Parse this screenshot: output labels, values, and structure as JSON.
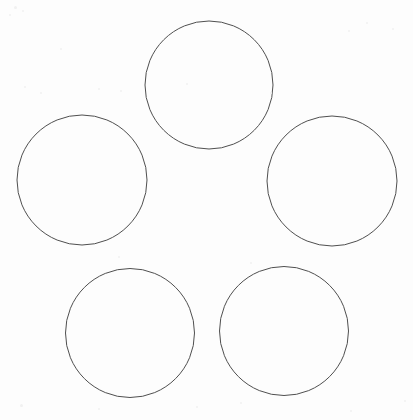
{
  "page": {
    "width": 413,
    "height": 420,
    "background_color": "#fdfdfd",
    "paper_type": "scanned-white-paper"
  },
  "figure": {
    "name": "five-circle-pentagon-arrangement",
    "shape_count": 5,
    "stroke_color": "#4f4f4f",
    "stroke_width": 1,
    "fill_color": "none",
    "circles": [
      {
        "id": "circle-top",
        "label": "top",
        "cx": 209,
        "cy": 85,
        "r": 64,
        "diameter": 128
      },
      {
        "id": "circle-left",
        "label": "left",
        "cx": 82,
        "cy": 180,
        "r": 65,
        "diameter": 130
      },
      {
        "id": "circle-right",
        "label": "right",
        "cx": 332,
        "cy": 181,
        "r": 65,
        "diameter": 130
      },
      {
        "id": "circle-bottom-left",
        "label": "bottom-left",
        "cx": 130,
        "cy": 333,
        "r": 64.5,
        "diameter": 129
      },
      {
        "id": "circle-bottom-right",
        "label": "bottom-right",
        "cx": 284,
        "cy": 331,
        "r": 64.5,
        "diameter": 129
      }
    ]
  },
  "artifacts": {
    "description": "Faint scanner noise and barely legible faded marks near the top corners",
    "top_left_mark": "",
    "top_right_mark": "",
    "specks": [
      {
        "x": 14,
        "y": 6,
        "size": 3
      },
      {
        "x": 22,
        "y": 10,
        "size": 2
      },
      {
        "x": 9,
        "y": 14,
        "size": 2
      },
      {
        "x": 60,
        "y": 48,
        "size": 2
      },
      {
        "x": 120,
        "y": 90,
        "size": 2
      },
      {
        "x": 24,
        "y": 86,
        "size": 2
      },
      {
        "x": 40,
        "y": 92,
        "size": 2
      },
      {
        "x": 98,
        "y": 88,
        "size": 2
      },
      {
        "x": 186,
        "y": 83,
        "size": 2
      },
      {
        "x": 270,
        "y": 92,
        "size": 2
      },
      {
        "x": 348,
        "y": 30,
        "size": 2
      },
      {
        "x": 366,
        "y": 22,
        "size": 2
      },
      {
        "x": 392,
        "y": 28,
        "size": 2
      },
      {
        "x": 118,
        "y": 256,
        "size": 2
      },
      {
        "x": 250,
        "y": 262,
        "size": 2
      },
      {
        "x": 20,
        "y": 404,
        "size": 3
      },
      {
        "x": 98,
        "y": 408,
        "size": 2
      },
      {
        "x": 196,
        "y": 406,
        "size": 2
      },
      {
        "x": 240,
        "y": 402,
        "size": 2
      },
      {
        "x": 350,
        "y": 410,
        "size": 2
      },
      {
        "x": 404,
        "y": 400,
        "size": 2
      }
    ]
  }
}
